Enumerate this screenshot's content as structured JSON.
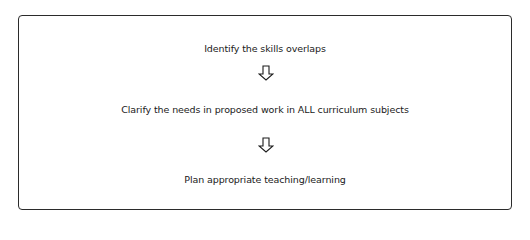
{
  "diagram": {
    "type": "flowchart",
    "direction": "top-to-bottom",
    "steps": [
      {
        "label": "Identify the skills overlaps"
      },
      {
        "label": "Clarify the needs in proposed work in ALL curriculum subjects"
      },
      {
        "label": "Plan appropriate teaching/learning"
      }
    ],
    "connectors": [
      {
        "icon": "down-arrow-icon",
        "from": 0,
        "to": 1
      },
      {
        "icon": "down-arrow-icon",
        "from": 1,
        "to": 2
      }
    ],
    "colors": {
      "border": "#2b2b2b",
      "text": "#1a1a1a",
      "background": "#ffffff"
    }
  }
}
